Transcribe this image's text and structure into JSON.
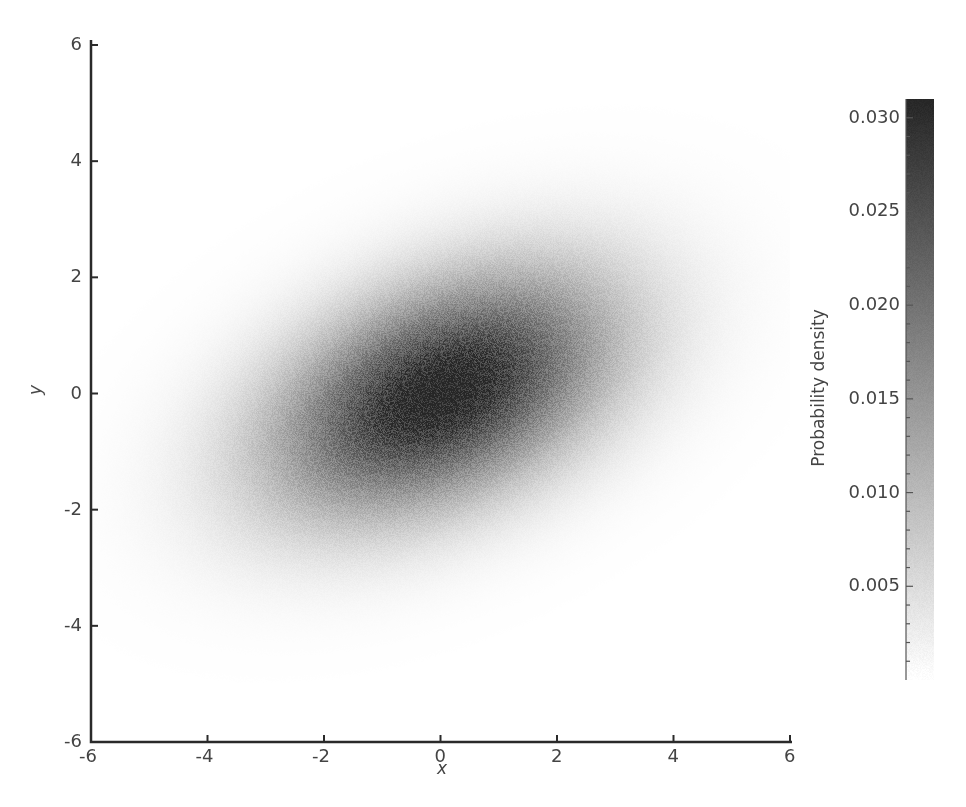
{
  "chart_data": {
    "type": "heatmap",
    "title": "",
    "xlabel": "x",
    "ylabel": "y",
    "xlim": [
      -6,
      6
    ],
    "ylim": [
      -6,
      6
    ],
    "x_ticks": [
      "-6",
      "-4",
      "-2",
      "0",
      "2",
      "4",
      "6"
    ],
    "y_ticks": [
      "6",
      "4",
      "2",
      "0",
      "-2",
      "-4",
      "-6"
    ],
    "grid": false,
    "distribution": {
      "kind": "bivariate normal (2D histogram of samples)",
      "mean": [
        0,
        0
      ],
      "covariance": [
        [
          4,
          1.2
        ],
        [
          1.2,
          2
        ]
      ],
      "peak_density": 0.031
    },
    "colorbar": {
      "label": "Probability density",
      "range": [
        0,
        0.031
      ],
      "ticks": [
        "0.030",
        "0.025",
        "0.020",
        "0.015",
        "0.010",
        "0.005"
      ],
      "colormap": "Greys",
      "low_color": "#ffffff",
      "high_color": "#262626"
    }
  }
}
